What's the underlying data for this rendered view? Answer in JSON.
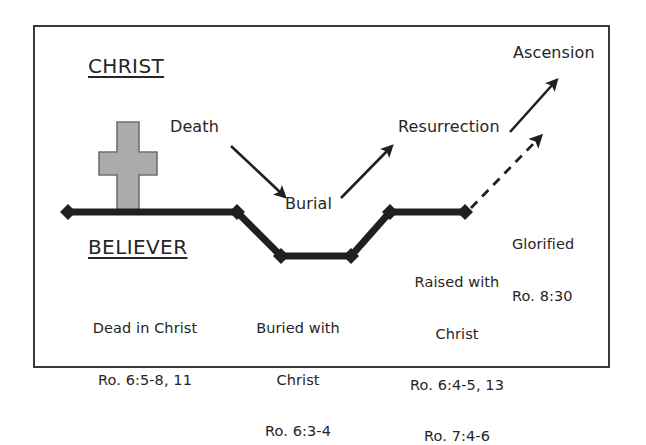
{
  "figure": {
    "headings": {
      "christ": "CHRIST",
      "believer": "BELIEVER"
    },
    "christ_events": [
      {
        "id": "death",
        "label": "Death"
      },
      {
        "id": "burial",
        "label": "Burial"
      },
      {
        "id": "resurrection",
        "label": "Resurrection"
      },
      {
        "id": "ascension",
        "label": "Ascension"
      }
    ],
    "believer_stages": [
      {
        "id": "dead-in-christ",
        "title": "Dead in Christ",
        "reference": "Ro. 6:5-8, 11",
        "lines": [
          "Dead in Christ",
          "Ro. 6:5-8, 11"
        ]
      },
      {
        "id": "buried-with-christ",
        "title": "Buried with Christ",
        "reference": "Ro. 6:3-4",
        "lines": [
          "Buried with",
          "Christ",
          "Ro. 6:3-4"
        ]
      },
      {
        "id": "raised-with-christ",
        "title": "Raised with Christ",
        "reference": "Ro. 6:4-5, 13 / Ro. 7:4-6",
        "lines": [
          "Raised with",
          "Christ",
          "Ro. 6:4-5, 13",
          "Ro. 7:4-6"
        ]
      },
      {
        "id": "glorified",
        "title": "Glorified",
        "reference": "Ro. 8:30",
        "lines": [
          "Glorified",
          "Ro. 8:30"
        ]
      }
    ],
    "colors": {
      "line": "#231f20",
      "cross_fill": "#ababab",
      "cross_stroke": "#6f6f6f",
      "frame": "#3a3a3a",
      "text": "#282526",
      "background": "#ffffff"
    },
    "shapes": {
      "cross": "latin-cross",
      "timeline_marker": "diamond",
      "timeline_points": [
        {
          "x": 68,
          "y": 212
        },
        {
          "x": 237,
          "y": 212
        },
        {
          "x": 281,
          "y": 256
        },
        {
          "x": 351,
          "y": 256
        },
        {
          "x": 390,
          "y": 212
        },
        {
          "x": 465,
          "y": 212
        }
      ],
      "arrows": [
        {
          "id": "death-arrow",
          "style": "solid",
          "from": [
            231,
            146
          ],
          "to": [
            285,
            197
          ]
        },
        {
          "id": "resurrection-arrow",
          "style": "solid",
          "from": [
            341,
            198
          ],
          "to": [
            391,
            147
          ]
        },
        {
          "id": "ascension-arrow",
          "style": "solid",
          "from": [
            510,
            132
          ],
          "to": [
            556,
            80
          ]
        },
        {
          "id": "glorified-arrow",
          "style": "dashed",
          "from": [
            472,
            207
          ],
          "to": [
            540,
            137
          ]
        }
      ]
    }
  }
}
